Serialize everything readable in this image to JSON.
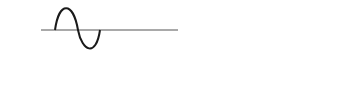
{
  "labels": {
    "input": "input",
    "output": "output",
    "annotation": "inverted by diode"
  },
  "colors": {
    "stroke": "#1a1a1a",
    "axis": "#555555",
    "background": "#ffffff"
  },
  "input_panel": {
    "waveform": "sine",
    "cycles": 2,
    "axis_style": "solid",
    "note": "two full sine cycles; negative lobes are those inverted by diode"
  },
  "output_panel": {
    "waveform": "rectified sine",
    "humps": 4,
    "positive_style": "solid",
    "original_negative_style": "dashed",
    "note": "negative half-cycles flipped positive; dashed shows original negative lobes"
  }
}
